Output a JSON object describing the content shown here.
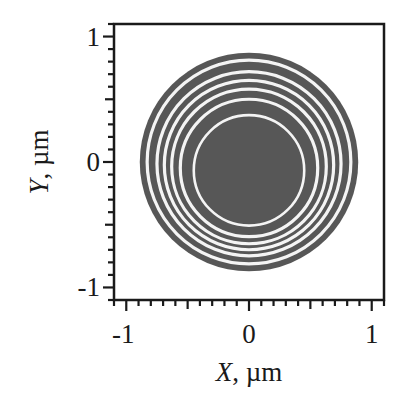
{
  "chart_data": {
    "type": "heatmap",
    "subtype": "2D intensity map of concentric rings (focal spot)",
    "title": "",
    "xlabel": "X, µm",
    "ylabel": "Y, µm",
    "xlim": [
      -1.1,
      1.1
    ],
    "ylim": [
      -1.1,
      1.1
    ],
    "x_ticks": [
      -1,
      0,
      1
    ],
    "y_ticks": [
      -1,
      0,
      1
    ],
    "x_tick_labels": [
      "-1",
      "0",
      "1"
    ],
    "y_tick_labels": [
      "-1",
      "0",
      "1"
    ],
    "minor_tick_step": 0.1,
    "grid": false,
    "legend": null,
    "disk": {
      "center": [
        0,
        0
      ],
      "radius_um": 0.89,
      "color": "#575757"
    },
    "white_rings_radius_um_approx": [
      0.45,
      0.56,
      0.63,
      0.69,
      0.75,
      0.83
    ],
    "note": "White-ring radii are approximate, estimated from rough pixel positions in low-resolution crops; rings appear slightly eccentric (narrower gaps at top)",
    "background": "#ffffff"
  },
  "axes": {
    "x_label_var": "X",
    "x_label_unit": ", µm",
    "y_label_var": "Y",
    "y_label_unit": ", µm"
  }
}
